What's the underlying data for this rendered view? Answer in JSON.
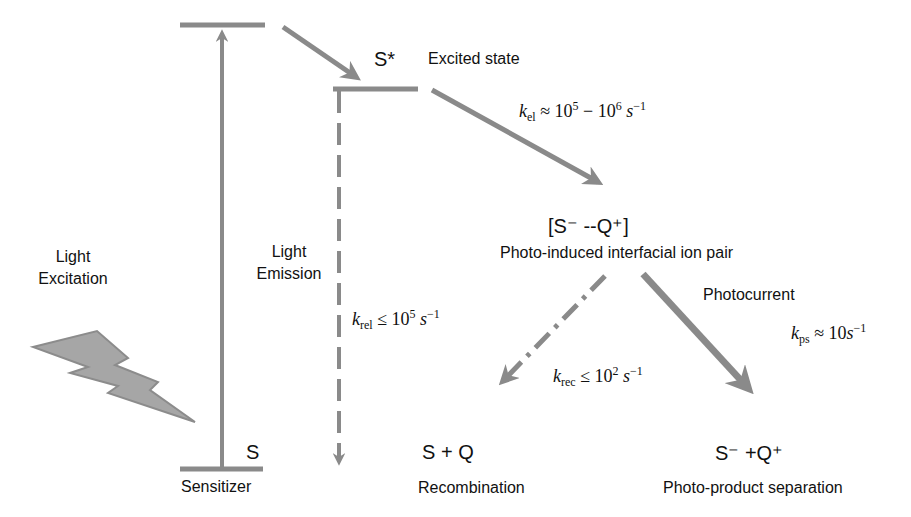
{
  "colors": {
    "line": "#8a8a8a",
    "arrow": "#8a8a8a",
    "bolt_fill": "#a6a6a6",
    "bolt_stroke": "#8c8c8c",
    "text": "#111111",
    "background": "#ffffff"
  },
  "states": {
    "ground_symbol": "S",
    "ground_label": "Sensitizer",
    "excited_symbol": "S*",
    "excited_label": "Excited state",
    "ion_pair_symbol": "[S⁻ --Q⁺]",
    "ion_pair_label": "Photo-induced interfacial ion pair",
    "recombination_symbol": "S + Q",
    "recombination_label": "Recombination",
    "separation_symbol": "S⁻ +Q⁺",
    "separation_label": "Photo-product separation"
  },
  "processes": {
    "excitation_label_line1": "Light",
    "excitation_label_line2": "Excitation",
    "emission_label_line1": "Light",
    "emission_label_line2": "Emission",
    "photocurrent_label": "Photocurrent"
  },
  "rates": {
    "k_el": {
      "k": "k",
      "sub": "el",
      "rel": " ≈ 10",
      "exp1": "5",
      "mid": " − 10",
      "exp2": "6",
      "unit": " s",
      "unit_exp": "−1"
    },
    "k_rel": {
      "k": "k",
      "sub": "rel",
      "rel": " ≤ 10",
      "exp1": "5",
      "unit": " s",
      "unit_exp": "−1"
    },
    "k_rec": {
      "k": "k",
      "sub": "rec",
      "rel": " ≤ 10",
      "exp1": "2",
      "unit": " s",
      "unit_exp": "−1"
    },
    "k_ps": {
      "k": "k",
      "sub": "ps",
      "rel": " ≈ 10",
      "unit": "s",
      "unit_exp": "−1"
    }
  },
  "icons": {
    "bolt": "lightning-bolt-icon"
  }
}
